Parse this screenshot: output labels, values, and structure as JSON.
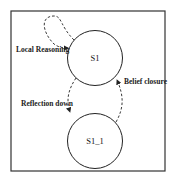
{
  "diagram": {
    "type": "state-transition",
    "states": [
      {
        "id": "s1",
        "label": "S1"
      },
      {
        "id": "s1_1",
        "label": "S1_1"
      }
    ],
    "transitions": [
      {
        "from": "S1",
        "to": "S1",
        "label": "Local Reasoning",
        "style": "dashed",
        "kind": "self-loop"
      },
      {
        "from": "S1",
        "to": "S1_1",
        "label": "Reflection down",
        "style": "dashed"
      },
      {
        "from": "S1_1",
        "to": "S1",
        "label": "Belief closure",
        "style": "dashed"
      }
    ],
    "colors": {
      "stroke": "#222222",
      "background": "#ffffff"
    }
  }
}
